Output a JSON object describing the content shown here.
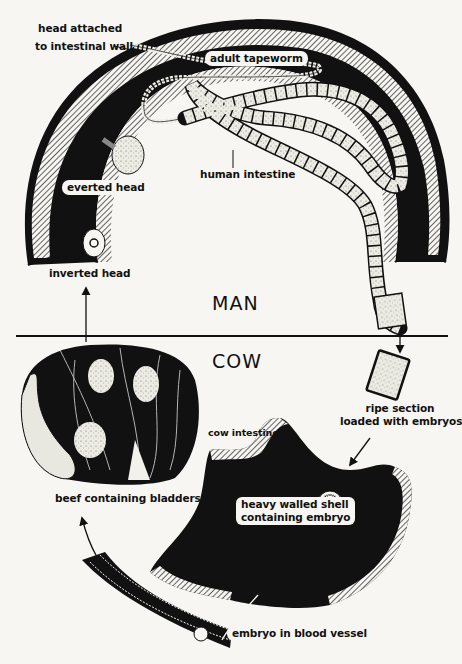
{
  "sections": {
    "top": "MAN",
    "bottom": "COW"
  },
  "labels": {
    "head_attached_line1": "head attached",
    "head_attached_line2": "to intestinal wall",
    "adult_tapeworm": "adult tapeworm",
    "everted_head": "everted head",
    "human_intestine": "human intestine",
    "inverted_head": "inverted head",
    "ripe_section_line1": "ripe section",
    "ripe_section_line2": "loaded with embryos",
    "cow_intestine": "cow intestine",
    "beef_containing_bladders": "beef containing bladders",
    "heavy_walled_shell_line1": "heavy walled shell",
    "heavy_walled_shell_line2": "containing embryo",
    "embryo_in_blood_vessel": "embryo in blood vessel"
  },
  "colors": {
    "ink": "#111111",
    "paper": "#f7f6f2",
    "segment": "#ecebe4"
  }
}
